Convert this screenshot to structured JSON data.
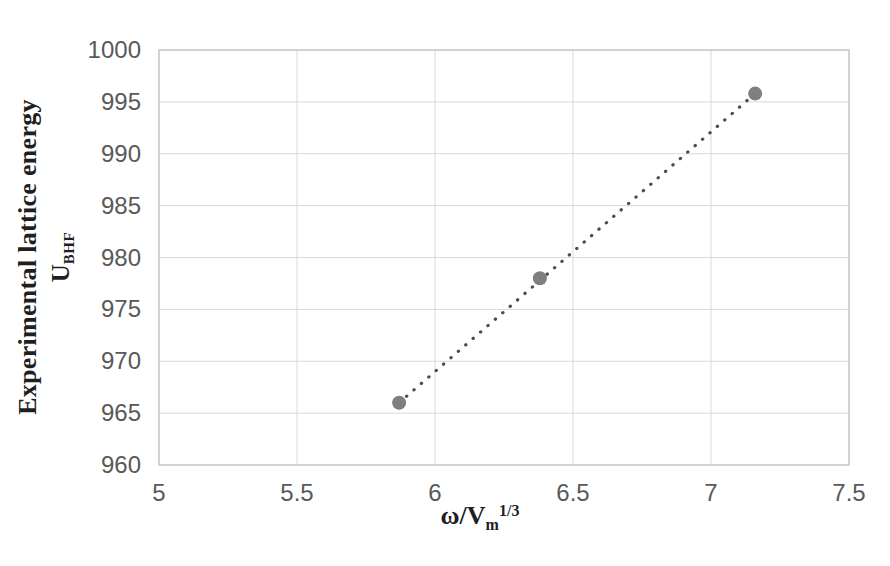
{
  "chart_data": {
    "type": "scatter",
    "title": "",
    "xlabel_plain": "ω/Vm^(1/3)",
    "xlabel": {
      "base": "ω/V",
      "sub": "m",
      "sup": "1/3"
    },
    "ylabel_plain": "Experimental lattice energy U_BHF",
    "ylabel": {
      "line1": "Experimental lattice energy",
      "line2_base": "U",
      "line2_sub": "BHF"
    },
    "points": [
      {
        "x": 5.87,
        "y": 966.0
      },
      {
        "x": 6.38,
        "y": 978.0
      },
      {
        "x": 7.16,
        "y": 995.8
      }
    ],
    "trendline": {
      "style": "dotted-linear",
      "from": {
        "x": 5.87,
        "y": 966.0
      },
      "to": {
        "x": 7.16,
        "y": 995.8
      }
    },
    "x_ticks": {
      "values": [
        5,
        5.5,
        6,
        6.5,
        7,
        7.5
      ],
      "labels": [
        "5",
        "5.5",
        "6",
        "6.5",
        "7",
        "7.5"
      ]
    },
    "y_ticks": {
      "values": [
        960,
        965,
        970,
        975,
        980,
        985,
        990,
        995,
        1000
      ],
      "labels": [
        "960",
        "965",
        "970",
        "975",
        "980",
        "985",
        "990",
        "995",
        "1000"
      ]
    },
    "xlim": [
      5,
      7.5
    ],
    "ylim": [
      960,
      1000
    ],
    "grid": true,
    "legend": "none",
    "colors": {
      "background": "#ffffff",
      "gridline": "#d9d9d9",
      "plot_border": "#c6c6c6",
      "tick_label": "#595959",
      "axis_title": "#1f1f1f",
      "marker": "#7f7f7f",
      "trendline": "#4d4d4d"
    }
  }
}
